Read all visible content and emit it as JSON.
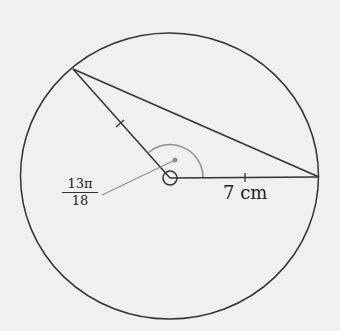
{
  "diagram": {
    "type": "circle-sector-triangle",
    "circle": {
      "cx": 169.5,
      "cy": 176,
      "rx": 149,
      "ry": 143
    },
    "center": {
      "x": 170,
      "y": 178
    },
    "vertices": {
      "top_left": {
        "x": 73,
        "y": 69
      },
      "right": {
        "x": 319,
        "y": 177
      }
    },
    "angle_label": {
      "numerator": "13π",
      "denominator": "18"
    },
    "radius_label": "7 cm",
    "colors": {
      "stroke": "#333333",
      "annotation": "#909090",
      "background": "#f0f0ee"
    }
  }
}
